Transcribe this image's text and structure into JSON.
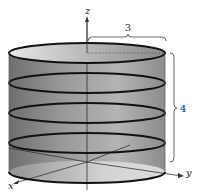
{
  "diagram": {
    "type": "3d-cylinder",
    "axes": {
      "x_label": "x",
      "y_label": "y",
      "z_label": "z"
    },
    "dimensions": {
      "radius_label": "3",
      "height_label": "4"
    },
    "cross_sections": 5,
    "colors": {
      "stroke": "#111111",
      "surface_dark": "#7a7a7a",
      "surface_light": "#dcdcdc",
      "axis": "#333333"
    }
  }
}
